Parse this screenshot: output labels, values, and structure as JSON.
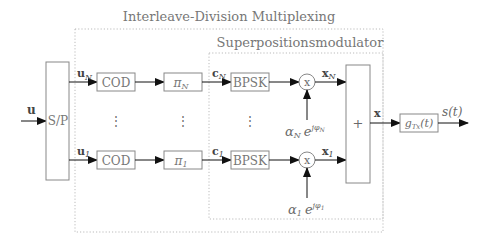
{
  "diagram": {
    "outer_group": {
      "title": "Interleave-Division Multiplexing"
    },
    "inner_group": {
      "title": "Superpositionsmodulator"
    },
    "input": {
      "label": "u"
    },
    "sp_block": {
      "label": "S/P"
    },
    "branches": [
      {
        "index": "N",
        "input_label": "u",
        "input_sub": "N",
        "cod_label": "COD",
        "interleaver_label": "π",
        "interleaver_sub": "N",
        "c_label": "c",
        "c_sub": "N",
        "mod_label": "BPSK",
        "mult_label": "x",
        "x_label": "x",
        "x_sub": "N",
        "gain_alpha": "α",
        "gain_alpha_sub": "N",
        "gain_exp_base": "e",
        "gain_exp": "jφ",
        "gain_exp_sub": "N"
      },
      {
        "index": "1",
        "input_label": "u",
        "input_sub": "1",
        "cod_label": "COD",
        "interleaver_label": "π",
        "interleaver_sub": "1",
        "c_label": "c",
        "c_sub": "1",
        "mod_label": "BPSK",
        "mult_label": "x",
        "x_label": "x",
        "x_sub": "1",
        "gain_alpha": "α",
        "gain_alpha_sub": "1",
        "gain_exp_base": "e",
        "gain_exp": "jφ",
        "gain_exp_sub": "1"
      }
    ],
    "ellipsis": "⋮",
    "sum_block": {
      "label": "+"
    },
    "sum_output": {
      "label": "x"
    },
    "pulse_filter": {
      "label": "g",
      "sub": "Tx",
      "arg": "(t)"
    },
    "output": {
      "label": "s(t)"
    }
  }
}
